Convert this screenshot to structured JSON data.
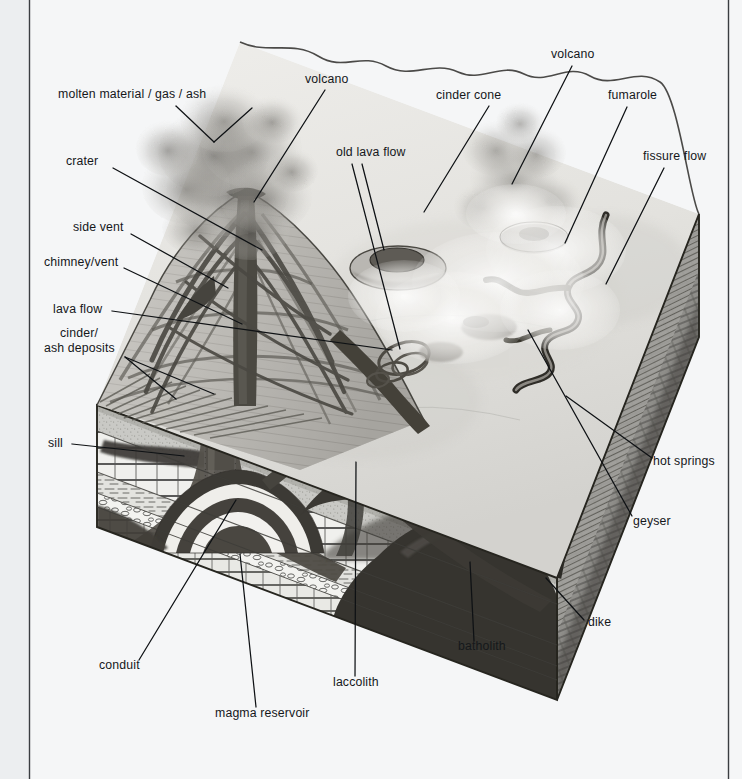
{
  "page": {
    "background_color": "#f5f6f7",
    "ink_color": "#15181b",
    "gutter_line_color": "#3a3d41",
    "title": "",
    "figure_type": "block-diagram-volcano-cutaway"
  },
  "labels": [
    {
      "id": "molten-material",
      "text": "molten material / gas / ash",
      "anchor": "start",
      "x": 58,
      "y": 98
    },
    {
      "id": "volcano-left",
      "text": "volcano",
      "anchor": "start",
      "x": 305,
      "y": 83
    },
    {
      "id": "cinder-cone",
      "text": "cinder cone",
      "anchor": "start",
      "x": 436,
      "y": 99
    },
    {
      "id": "volcano-right",
      "text": "volcano",
      "anchor": "start",
      "x": 551,
      "y": 58
    },
    {
      "id": "fumarole",
      "text": "fumarole",
      "anchor": "start",
      "x": 608,
      "y": 99
    },
    {
      "id": "crater",
      "text": "crater",
      "anchor": "start",
      "x": 66,
      "y": 165
    },
    {
      "id": "old-lava-flow",
      "text": "old lava flow",
      "anchor": "start",
      "x": 336,
      "y": 156
    },
    {
      "id": "fissure-flow",
      "text": "fissure flow",
      "anchor": "start",
      "x": 643,
      "y": 160
    },
    {
      "id": "side-vent",
      "text": "side vent",
      "anchor": "start",
      "x": 73,
      "y": 231
    },
    {
      "id": "chimney-vent",
      "text": "chimney/vent",
      "anchor": "start",
      "x": 44,
      "y": 266
    },
    {
      "id": "lava-flow",
      "text": "lava flow",
      "anchor": "start",
      "x": 53,
      "y": 313
    },
    {
      "id": "cinder-deposits-1",
      "text": "cinder/",
      "anchor": "start",
      "x": 60,
      "y": 337
    },
    {
      "id": "cinder-deposits-2",
      "text": "ash deposits",
      "anchor": "start",
      "x": 44,
      "y": 352
    },
    {
      "id": "sill",
      "text": "sill",
      "anchor": "start",
      "x": 48,
      "y": 447
    },
    {
      "id": "hot-springs",
      "text": "hot springs",
      "anchor": "start",
      "x": 653,
      "y": 465
    },
    {
      "id": "geyser",
      "text": "geyser",
      "anchor": "start",
      "x": 633,
      "y": 525
    },
    {
      "id": "dike",
      "text": "dike",
      "anchor": "start",
      "x": 588,
      "y": 626
    },
    {
      "id": "batholith",
      "text": "batholith",
      "anchor": "start",
      "x": 458,
      "y": 650
    },
    {
      "id": "conduit",
      "text": "conduit",
      "anchor": "start",
      "x": 99,
      "y": 669
    },
    {
      "id": "laccolith",
      "text": "laccolith",
      "anchor": "start",
      "x": 333,
      "y": 686
    },
    {
      "id": "magma-reservoir",
      "text": "magma reservoir",
      "anchor": "start",
      "x": 215,
      "y": 717
    }
  ],
  "leaders": [
    {
      "for": "molten-material",
      "path": "M 176 106 L 212 140"
    },
    {
      "for": "volcano-left",
      "path": "M 323 90 L 256 199"
    },
    {
      "for": "cinder-cone",
      "path": "M 487 105 L 430 208"
    },
    {
      "for": "volcano-right",
      "path": "M 570 65 L 513 181"
    },
    {
      "for": "fumarole",
      "path": "M 625 106 L 568 241"
    },
    {
      "for": "crater",
      "path": "M 113 168 L 261 248"
    },
    {
      "for": "old-lava-flow",
      "path": "M 354 163 L 395 345"
    },
    {
      "for": "old-lava-flow-2",
      "path": "M 362 163 L 384 252"
    },
    {
      "for": "fissure-flow",
      "path": "M 662 167 L 620 280"
    },
    {
      "for": "side-vent",
      "path": "M 128 234 L 229 286"
    },
    {
      "for": "chimney-vent",
      "path": "M 122 268 L 242 322"
    },
    {
      "for": "lava-flow",
      "path": "M 111 310 L 389 349"
    },
    {
      "for": "cinder-deposits",
      "path": "M 124 356 L 209 392"
    },
    {
      "for": "cinder-deposits-b",
      "path": "M 124 356 L 175 397"
    },
    {
      "for": "sill",
      "path": "M 72 444 L 182 454"
    },
    {
      "for": "hot-springs",
      "path": "M 654 458 L 568 395"
    },
    {
      "for": "geyser",
      "path": "M 636 516 L 530 331"
    },
    {
      "for": "dike",
      "path": "M 586 620 L 547 578"
    },
    {
      "for": "batholith",
      "path": "M 474 642 L 470 562"
    },
    {
      "for": "conduit",
      "path": "M 139 661 L 236 498"
    },
    {
      "for": "laccolith",
      "path": "M 355 677 L 356 461"
    },
    {
      "for": "magma-reservoir",
      "path": "M 255 708 L 240 553"
    }
  ],
  "figure": {
    "block": {
      "top_front_left": [
        97,
        405
      ],
      "top_front_right": [
        557,
        578
      ],
      "right_corner": [
        699,
        214
      ],
      "back_left": [
        97,
        215
      ],
      "depth_px": 190
    },
    "strata": [
      {
        "name": "soil-overburden",
        "color": "#c9c9c6",
        "pattern": "stipple"
      },
      {
        "name": "limestone-upper",
        "color": "#efefec",
        "pattern": "brick"
      },
      {
        "name": "sandstone",
        "color": "#dededa",
        "pattern": "dash"
      },
      {
        "name": "conglomerate",
        "color": "#f2f2ef",
        "pattern": "pebble"
      },
      {
        "name": "limestone-lower",
        "color": "#e6e6e2",
        "pattern": "brick"
      },
      {
        "name": "shale",
        "color": "#dcdcd8",
        "pattern": "dash"
      }
    ],
    "features": [
      {
        "name": "volcano-cone",
        "description": "central stratovolcano cutaway with radiating dikes"
      },
      {
        "name": "eruption-plume",
        "description": "ash and gas cloud above main volcano"
      },
      {
        "name": "cinder-cone",
        "description": "small cone with crater on right plateau"
      },
      {
        "name": "fumarole-cone",
        "description": "small steaming cone right of centre"
      },
      {
        "name": "fissure-flow",
        "description": "sinuous lava channel on right top surface"
      },
      {
        "name": "conduit",
        "description": "vertical magma conduit to surface"
      },
      {
        "name": "magma-reservoir",
        "description": "banded magma chamber at base"
      },
      {
        "name": "laccolith",
        "description": "mushroom shaped intrusion right of conduit"
      },
      {
        "name": "sill",
        "description": "horizontal tabular intrusion left side"
      },
      {
        "name": "batholith",
        "description": "large dark intrusive mass lower right"
      },
      {
        "name": "dike",
        "description": "inclined intrusion reaching right corner"
      }
    ]
  },
  "gutters": {
    "left_x": 29,
    "right_x": 729
  }
}
